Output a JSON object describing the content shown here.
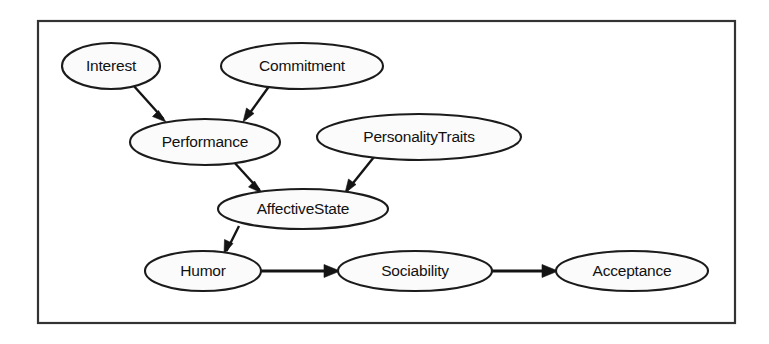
{
  "diagram": {
    "type": "directed-graph",
    "title": "",
    "background_color": "#ffffff",
    "frame": {
      "present": true,
      "x": 38,
      "y": 21,
      "width": 697,
      "height": 302,
      "stroke_color": "#333333",
      "fill_color": "#ffffff"
    },
    "node_style": {
      "shape": "ellipse",
      "fill_color": "#fbfbfb",
      "stroke_color": "#1b1b1b",
      "text_color": "#111111"
    },
    "edge_style": {
      "stroke_color": "#141414",
      "arrowhead": "filled-triangle"
    },
    "nodes": [
      {
        "id": "interest",
        "label": "Interest",
        "cx": 111,
        "cy": 66,
        "rx": 49,
        "ry": 23
      },
      {
        "id": "commitment",
        "label": "Commitment",
        "cx": 302,
        "cy": 66,
        "rx": 81,
        "ry": 23
      },
      {
        "id": "performance",
        "label": "Performance",
        "cx": 205,
        "cy": 142,
        "rx": 75,
        "ry": 23
      },
      {
        "id": "personalitytraits",
        "label": "PersonalityTraits",
        "cx": 419,
        "cy": 137,
        "rx": 102,
        "ry": 23
      },
      {
        "id": "affectivestate",
        "label": "AffectiveState",
        "cx": 303,
        "cy": 209,
        "rx": 85,
        "ry": 20
      },
      {
        "id": "humor",
        "label": "Humor",
        "cx": 203,
        "cy": 271,
        "rx": 58,
        "ry": 20
      },
      {
        "id": "sociability",
        "label": "Sociability",
        "cx": 415,
        "cy": 271,
        "rx": 77,
        "ry": 20
      },
      {
        "id": "acceptance",
        "label": "Acceptance",
        "cx": 632,
        "cy": 271,
        "rx": 76,
        "ry": 20
      }
    ],
    "edges": [
      {
        "id": "interest-performance",
        "from": "Interest",
        "to": "Performance",
        "x1": 133,
        "y1": 85,
        "x2": 166,
        "y2": 122
      },
      {
        "id": "commitment-performance",
        "from": "Commitment",
        "to": "Performance",
        "x1": 270,
        "y1": 85,
        "x2": 243,
        "y2": 122
      },
      {
        "id": "performance-affectivestate",
        "from": "Performance",
        "to": "AffectiveState",
        "x1": 233,
        "y1": 161,
        "x2": 262,
        "y2": 193
      },
      {
        "id": "personalitytraits-affectivestate",
        "from": "PersonalityTraits",
        "to": "AffectiveState",
        "x1": 374,
        "y1": 157,
        "x2": 345,
        "y2": 193
      },
      {
        "id": "affectivestate-humor",
        "from": "AffectiveState",
        "to": "Humor",
        "x1": 239,
        "y1": 226,
        "x2": 224,
        "y2": 254
      },
      {
        "id": "humor-sociability",
        "from": "Humor",
        "to": "Sociability",
        "x1": 261,
        "y1": 271,
        "x2": 339,
        "y2": 271
      },
      {
        "id": "sociability-acceptance",
        "from": "Sociability",
        "to": "Acceptance",
        "x1": 492,
        "y1": 271,
        "x2": 557,
        "y2": 271
      }
    ]
  }
}
